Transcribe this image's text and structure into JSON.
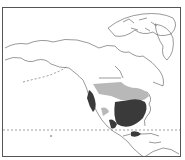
{
  "caption": {
    "text": ""
  },
  "map": {
    "type": "species-range-map",
    "region": "North America",
    "colors": {
      "outline": "#555555",
      "primary_range": "#3a3a3a",
      "secondary_range": "#b8b8b8",
      "background": "#ffffff",
      "dashed_line": "#777777"
    },
    "legend_visible": false
  }
}
